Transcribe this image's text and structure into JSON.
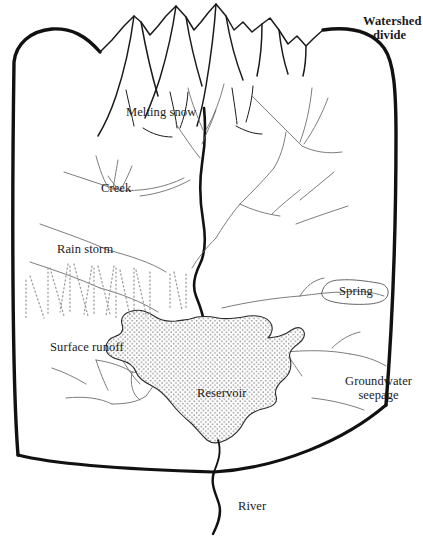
{
  "figure": {
    "kind": "watershed-diagram",
    "background_color": "#ffffff",
    "ink_color": "#111111",
    "thin_line_color": "#555555",
    "rain_color": "#9a9a9a",
    "stipple_color": "#8a8a8a"
  },
  "labels": {
    "watershed_divide_line1": "Watershed",
    "watershed_divide_line2": "divide",
    "melting_snow": "Melting snow",
    "creek": "Creek",
    "rain_storm": "Rain storm",
    "surface_runoff": "Surface runoff",
    "spring": "Spring",
    "reservoir": "Reservoir",
    "groundwater_line1": "Groundwater",
    "groundwater_line2": "seepage",
    "river": "River"
  },
  "features": {
    "mountains": "mountain-range-ridgeline",
    "main_channel": "main-river-channel",
    "tributaries": "dendritic-tributary-streams",
    "reservoir_body": "stippled-reservoir-polygon",
    "rain_shaft": "dotted-rain-streaks",
    "outlet": "river-outlet-below-divide"
  }
}
